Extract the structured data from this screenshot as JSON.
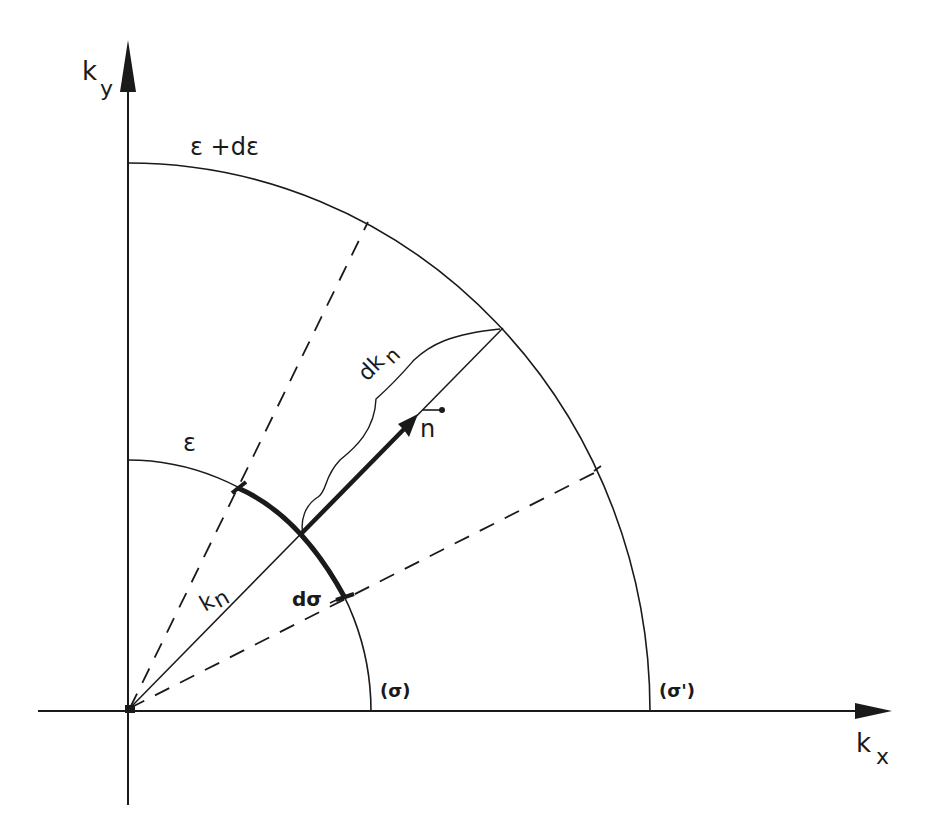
{
  "diagram": {
    "type": "geometric-construction",
    "axes": {
      "x_label_main": "k",
      "x_label_sub": "x",
      "y_label_main": "k",
      "y_label_sub": "y"
    },
    "surfaces": {
      "inner_label": "ε",
      "outer_label": "ε +dε",
      "inner_tag": "(σ)",
      "outer_tag": "(σ')"
    },
    "vectors": {
      "radius_label_main": "k",
      "radius_label_sub": "n",
      "thickness_label_main": "dk",
      "thickness_label_sub": "n",
      "normal_label": "n",
      "element_label": "dσ"
    },
    "colors": {
      "ink": "#1a1a1a",
      "background": "#ffffff"
    }
  }
}
